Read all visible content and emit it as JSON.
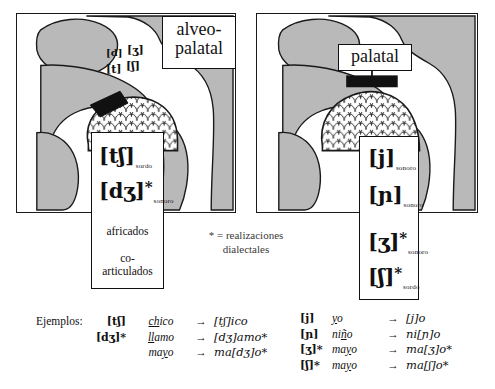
{
  "figure": {
    "dialect_note": {
      "line1": "* = realizaciones",
      "line2": "dialectales"
    }
  },
  "left_panel": {
    "place_label": {
      "line1": "alveo-",
      "line2": "palatal"
    },
    "articulation_labels": {
      "top_left": "[d]",
      "top_right": "[ʒ]",
      "bottom_left": "[t]",
      "bottom_right": "[ʃ]"
    },
    "phoneme_box": {
      "rows": [
        {
          "symbol": "[tʃ]",
          "star": "",
          "voicing": "sordo"
        },
        {
          "symbol": "[dʒ]",
          "star": "*",
          "voicing": "sonoro"
        }
      ],
      "category_line1": "africados",
      "category_line2": "co-",
      "category_line3": "articulados"
    }
  },
  "right_panel": {
    "place_label": {
      "line1": "palatal",
      "line2": ""
    },
    "phoneme_box": {
      "rows": [
        {
          "symbol": "[j]",
          "star": "",
          "voicing": "sonoro"
        },
        {
          "symbol": "[ɲ]",
          "star": "",
          "voicing": "sonoro"
        },
        {
          "symbol": "[ʒ]",
          "star": "*",
          "voicing": "sonoro"
        },
        {
          "symbol": "[ʃ]",
          "star": "*",
          "voicing": "sordo"
        }
      ]
    }
  },
  "examples_left": {
    "lead_label": "Ejemplos:",
    "rows": [
      {
        "symbol": "[tʃ]",
        "word_pre": "",
        "word_underline": "ch",
        "word_post": "ico",
        "arrow": "→",
        "output": "[tʃ]ico"
      },
      {
        "symbol": "[dʒ]*",
        "word_pre": "",
        "word_underline": "ll",
        "word_post": "amo",
        "arrow": "→",
        "output": "[dʒ]amo*"
      },
      {
        "symbol": "",
        "word_pre": "ma",
        "word_underline": "y",
        "word_post": "o",
        "arrow": "→",
        "output": "ma[dʒ]o*"
      }
    ]
  },
  "examples_right": {
    "rows": [
      {
        "symbol": "[j]",
        "word_pre": "",
        "word_underline": "y",
        "word_post": "o",
        "arrow": "→",
        "output": "[j]o"
      },
      {
        "symbol": "[ɲ]",
        "word_pre": "ni",
        "word_underline": "ñ",
        "word_post": "o",
        "arrow": "→",
        "output": "ni[ɲ]o"
      },
      {
        "symbol": "[ʒ]*",
        "word_pre": "ma",
        "word_underline": "y",
        "word_post": "o",
        "arrow": "→",
        "output": "ma[ʒ]o*"
      },
      {
        "symbol": "[ʃ]*",
        "word_pre": "ma",
        "word_underline": "y",
        "word_post": "o",
        "arrow": "→",
        "output": "ma[ʃ]o*"
      }
    ]
  }
}
